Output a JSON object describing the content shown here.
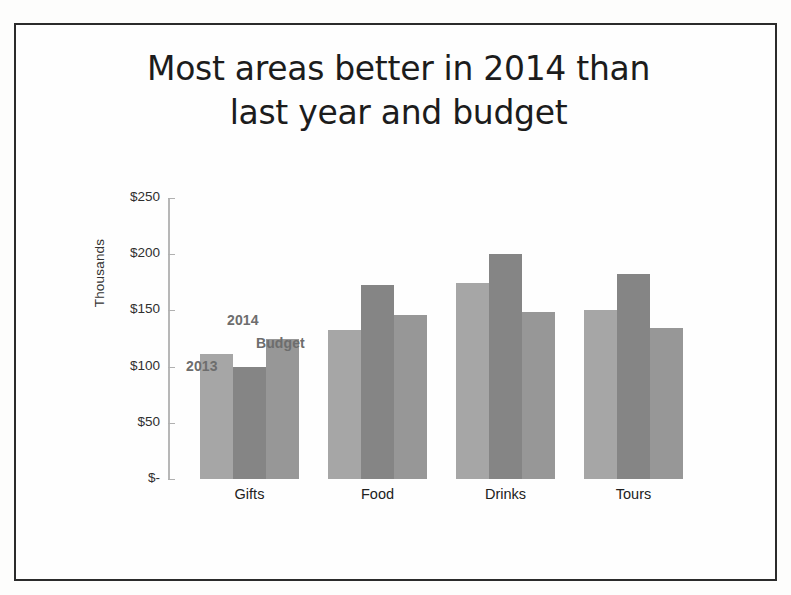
{
  "slide": {
    "title_line1": "Most areas better in 2014 than",
    "title_line2": "last year and budget"
  },
  "chart_data": {
    "type": "bar",
    "title": "Most areas better in 2014 than last year and budget",
    "xlabel": "",
    "ylabel": "Thousands",
    "categories": [
      "Gifts",
      "Food",
      "Drinks",
      "Tours"
    ],
    "series": [
      {
        "name": "2013",
        "color": "#a6a6a6",
        "values": [
          111,
          133,
          174,
          150
        ]
      },
      {
        "name": "2014",
        "color": "#858585",
        "values": [
          100,
          173,
          200,
          182
        ]
      },
      {
        "name": "Budget",
        "color": "#979797",
        "values": [
          125,
          146,
          149,
          134
        ]
      }
    ],
    "ylim": [
      0,
      250
    ],
    "ytick_values": [
      250,
      200,
      150,
      100,
      50,
      0
    ],
    "ytick_labels": [
      "$250",
      "$200",
      "$150",
      "$100",
      "$50",
      "$-"
    ],
    "grid": false,
    "legend_position": "inline-annotations-above-first-group",
    "annotations": [
      {
        "text": "2013",
        "series": "2013"
      },
      {
        "text": "2014",
        "series": "2014"
      },
      {
        "text": "Budget",
        "series": "Budget"
      }
    ],
    "value_prefix": "$",
    "value_unit": "Thousands"
  },
  "colors": {
    "frame": "#2b2b2b",
    "axis": "#b7b7b7",
    "title_text": "#1c1c1c",
    "tick_text": "#2f2f2f",
    "annotation_text": "#6d6d6d",
    "background": "#fefefe"
  }
}
